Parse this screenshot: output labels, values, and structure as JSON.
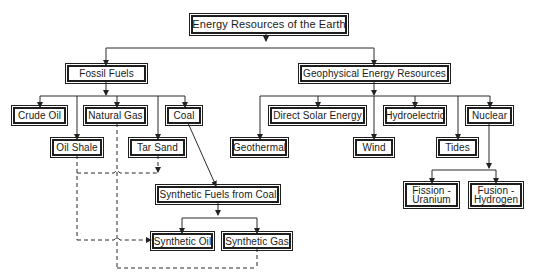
{
  "diagram": {
    "title": "Energy Resources of the Earth",
    "nodes": {
      "root": "Energy Resources of the Earth",
      "fossil": "Fossil Fuels",
      "geo": "Geophysical Energy Resources",
      "crude_oil": "Crude Oil",
      "natural_gas": "Natural Gas",
      "coal": "Coal",
      "oil_shale": "Oil Shale",
      "tar_sand": "Tar Sand",
      "synfuels": "Synthetic Fuels from Coal",
      "synthetic_oil": "Synthetic Oil",
      "synthetic_gas": "Synthetic Gas",
      "direct_solar": "Direct Solar Energy",
      "hydroelectric": "Hydroelectric",
      "nuclear": "Nuclear",
      "geothermal": "Geothermal",
      "wind": "Wind",
      "tides": "Tides",
      "fission_line1": "Fission -",
      "fission_line2": "Uranium",
      "fusion_line1": "Fusion -",
      "fusion_line2": "Hydrogen"
    },
    "edges": [
      {
        "from": "root",
        "to": "fossil",
        "style": "solid"
      },
      {
        "from": "root",
        "to": "geo",
        "style": "solid"
      },
      {
        "from": "fossil",
        "to": "crude_oil",
        "style": "solid"
      },
      {
        "from": "fossil",
        "to": "oil_shale",
        "style": "solid"
      },
      {
        "from": "fossil",
        "to": "natural_gas",
        "style": "solid"
      },
      {
        "from": "fossil",
        "to": "tar_sand",
        "style": "solid"
      },
      {
        "from": "fossil",
        "to": "coal",
        "style": "solid"
      },
      {
        "from": "coal",
        "to": "synfuels",
        "style": "solid"
      },
      {
        "from": "synfuels",
        "to": "synthetic_oil",
        "style": "solid"
      },
      {
        "from": "synfuels",
        "to": "synthetic_gas",
        "style": "solid"
      },
      {
        "from": "oil_shale",
        "to": "synthetic_oil",
        "style": "dashed"
      },
      {
        "from": "tar_sand",
        "to": "synthetic_oil",
        "style": "dashed"
      },
      {
        "from": "natural_gas",
        "to": "synthetic_gas",
        "style": "dashed"
      },
      {
        "from": "geo",
        "to": "geothermal",
        "style": "solid"
      },
      {
        "from": "geo",
        "to": "direct_solar",
        "style": "solid"
      },
      {
        "from": "geo",
        "to": "wind",
        "style": "solid"
      },
      {
        "from": "geo",
        "to": "hydroelectric",
        "style": "solid"
      },
      {
        "from": "geo",
        "to": "tides",
        "style": "solid"
      },
      {
        "from": "geo",
        "to": "nuclear",
        "style": "solid"
      },
      {
        "from": "nuclear",
        "to": "fission",
        "style": "solid"
      },
      {
        "from": "nuclear",
        "to": "fusion",
        "style": "solid"
      }
    ]
  }
}
